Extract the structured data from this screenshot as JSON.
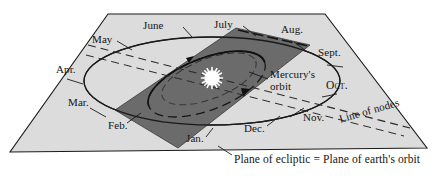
{
  "figure": {
    "colors": {
      "ecliptic_plane_fill": "#dcdcdc",
      "mercury_plane_fill": "#6b6b6b",
      "outline": "#1a1a1a",
      "sun": "#ffffff",
      "background": "#ffffff"
    },
    "month_labels": [
      {
        "key": "jan",
        "text": "Jan.",
        "x": 186,
        "y": 140
      },
      {
        "key": "feb",
        "text": "Feb.",
        "x": 108,
        "y": 127
      },
      {
        "key": "mar",
        "text": "Mar.",
        "x": 72,
        "y": 104
      },
      {
        "key": "apr",
        "text": "Apr.",
        "x": 62,
        "y": 70
      },
      {
        "key": "may",
        "text": "May",
        "x": 98,
        "y": 40
      },
      {
        "key": "jun",
        "text": "June",
        "x": 145,
        "y": 26
      },
      {
        "key": "jul",
        "text": "July",
        "x": 216,
        "y": 24
      },
      {
        "key": "aug",
        "text": "Aug.",
        "x": 284,
        "y": 29
      },
      {
        "key": "sept",
        "text": "Sept.",
        "x": 322,
        "y": 53
      },
      {
        "key": "oct",
        "text": "Oct.",
        "x": 330,
        "y": 85
      },
      {
        "key": "nov",
        "text": "Nov.",
        "x": 307,
        "y": 119
      },
      {
        "key": "dec",
        "text": "Dec.",
        "x": 247,
        "y": 130
      }
    ],
    "annotations": {
      "mercury_orbit": {
        "text": "Mercury's orbit",
        "x": 272,
        "y": 75
      },
      "line_of_nodes": {
        "text": "Line of nodes",
        "x": 345,
        "y": 122,
        "rotation": -17
      },
      "caption": {
        "text": "Plane of ecliptic = Plane of earth's orbit",
        "x": 234,
        "y": 160
      }
    }
  }
}
